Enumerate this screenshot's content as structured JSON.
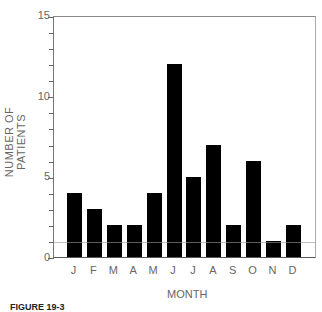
{
  "chart_data": {
    "type": "bar",
    "title": "",
    "xlabel": "MONTH",
    "ylabel": "NUMBER OF PATIENTS",
    "categories": [
      "J",
      "F",
      "M",
      "A",
      "M",
      "J",
      "J",
      "A",
      "S",
      "O",
      "N",
      "D"
    ],
    "values": [
      4,
      3,
      2,
      2,
      4,
      12,
      5,
      7,
      2,
      6,
      1,
      2
    ],
    "ylim": [
      0,
      15
    ],
    "yticks": [
      0,
      5,
      10,
      15
    ],
    "grid": false,
    "legend": null,
    "bar_color": "#000000"
  },
  "axis": {
    "y_tick_labels": [
      "0",
      "5",
      "10",
      "15"
    ],
    "x_title": "MONTH",
    "y_title": "NUMBER OF PATIENTS"
  },
  "caption": "FIGURE 19-3"
}
